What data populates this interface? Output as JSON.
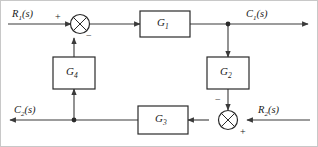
{
  "figure": {
    "type": "control-system-block-diagram",
    "frame_color": "#c8c8c8",
    "line_color": "#3a3a3a",
    "text_color": "#1a1a1a",
    "background": "#ffffff"
  },
  "signals": [
    {
      "id": "r1",
      "base": "R",
      "sub": "1",
      "suffix": "(s)",
      "role": "input",
      "position": "top-left",
      "direction": "right"
    },
    {
      "id": "c1",
      "base": "C",
      "sub": "1",
      "suffix": "(s)",
      "role": "output",
      "position": "top-right",
      "direction": "right"
    },
    {
      "id": "c2",
      "base": "C",
      "sub": "2",
      "suffix": "(s)",
      "role": "output",
      "position": "bottom-left",
      "direction": "left"
    },
    {
      "id": "r2",
      "base": "R",
      "sub": "2",
      "suffix": "(s)",
      "role": "input",
      "position": "bottom-right",
      "direction": "left"
    }
  ],
  "blocks": [
    {
      "id": "g1",
      "base": "G",
      "sub": "1",
      "position": "top-middle",
      "flow": "left-to-right"
    },
    {
      "id": "g2",
      "base": "G",
      "sub": "2",
      "position": "right-middle",
      "flow": "top-to-bottom"
    },
    {
      "id": "g3",
      "base": "G",
      "sub": "3",
      "position": "bottom-middle",
      "flow": "right-to-left"
    },
    {
      "id": "g4",
      "base": "G",
      "sub": "4",
      "position": "left-middle",
      "flow": "bottom-to-top"
    }
  ],
  "summing_junctions": [
    {
      "id": "sum-top",
      "position": "top-left",
      "glyph": "cross-circle",
      "inputs": [
        {
          "from": "r1",
          "sign": "+",
          "side": "left"
        },
        {
          "from": "g4",
          "sign": "-",
          "side": "bottom"
        }
      ],
      "output_to": "g1"
    },
    {
      "id": "sum-bottom",
      "position": "bottom-right",
      "glyph": "cross-circle",
      "inputs": [
        {
          "from": "r2",
          "sign": "+",
          "side": "right"
        },
        {
          "from": "g2",
          "sign": "-",
          "side": "top"
        }
      ],
      "output_to": "g3"
    }
  ],
  "junction_dots": [
    {
      "id": "dot-top-right",
      "branches_to": "g2",
      "on_path": "c1-output-line"
    },
    {
      "id": "dot-bottom-left",
      "branches_to": "g4",
      "on_path": "c2-output-line"
    }
  ],
  "signs": {
    "plus": "+",
    "minus": "−"
  }
}
